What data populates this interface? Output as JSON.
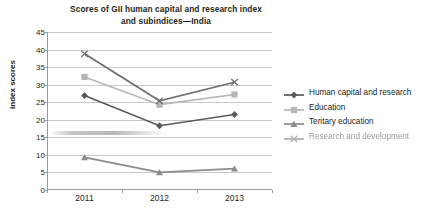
{
  "chart_data": {
    "type": "line",
    "title": "Scores of GII human capital and research index and subindices—India",
    "title_lines": [
      "Scores of GII human capital and research index",
      "and subindices—India"
    ],
    "xlabel": "",
    "ylabel": "index scores",
    "categories": [
      "2011",
      "2012",
      "2013"
    ],
    "x": [
      2011,
      2012,
      2013
    ],
    "ylim": [
      0,
      45
    ],
    "y_ticks": [
      "0",
      "5",
      "10",
      "15",
      "20",
      "25",
      "30",
      "35",
      "40",
      "45"
    ],
    "grid": true,
    "legend_position": "right",
    "series": [
      {
        "name": "Human capital and research",
        "marker": "diamond",
        "color": "#595959",
        "values": [
          26.9,
          18.3,
          21.5
        ]
      },
      {
        "name": "Education",
        "marker": "square",
        "color": "#b6b6b6",
        "values": [
          32.2,
          24.3,
          27.2
        ]
      },
      {
        "name": "Teritary education",
        "marker": "triangle",
        "color": "#8c8c8c",
        "values": [
          9.3,
          5.0,
          6.1
        ]
      },
      {
        "name": "Research and development",
        "marker": "x",
        "color": "#6e6e6e",
        "values": [
          38.8,
          25.4,
          30.7
        ]
      }
    ]
  },
  "legend": {
    "items": [
      {
        "label": "Human capital and research",
        "marker": "diamond-marker-icon"
      },
      {
        "label": "Education",
        "marker": "square-marker-icon"
      },
      {
        "label": "Teritary education",
        "marker": "triangle-marker-icon"
      },
      {
        "label": "Research and development",
        "marker": "x-marker-icon"
      }
    ]
  },
  "colors": {
    "gridline": "#c9c9c9",
    "axis": "#9a9a9a",
    "text": "#231f20",
    "background": "#ffffff"
  }
}
